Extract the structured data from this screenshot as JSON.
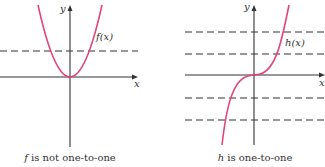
{
  "colors": {
    "curve": "#e0457b",
    "axis": "#333333",
    "background": "#ffffff"
  },
  "left_graph": {
    "function_label": "f(x)",
    "y_axis_label": "y",
    "x_axis_label": "x",
    "caption_var": "f",
    "caption_rest": " is not one-to-one",
    "curve_type": "parabola",
    "dashed_lines": 1
  },
  "right_graph": {
    "function_label": "h(x)",
    "y_axis_label": "y",
    "x_axis_label": "x",
    "caption_var": "h",
    "caption_rest": " is one-to-one",
    "curve_type": "cubic",
    "dashed_lines": 4
  }
}
